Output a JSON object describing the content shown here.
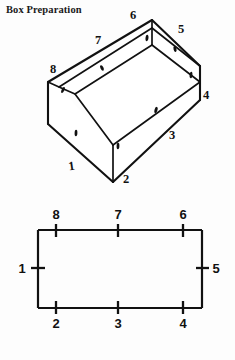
{
  "page": {
    "title": "Box Preparation",
    "background_color": "#fdfdfd",
    "ink_color": "#111111",
    "width": 235,
    "height": 360
  },
  "box_figure": {
    "name": "open-box-isometric",
    "description": "Open rectangular box drawn in oblique projection with eight numbered edge labels",
    "labels": [
      {
        "id": "box-label-1",
        "text": "1",
        "x": 72,
        "y": 170
      },
      {
        "id": "box-label-2",
        "text": "2",
        "x": 126,
        "y": 183
      },
      {
        "id": "box-label-3",
        "text": "3",
        "x": 172,
        "y": 139
      },
      {
        "id": "box-label-4",
        "text": "4",
        "x": 204,
        "y": 98
      },
      {
        "id": "box-label-5",
        "text": "5",
        "x": 181,
        "y": 31
      },
      {
        "id": "box-label-6",
        "text": "6",
        "x": 133,
        "y": 18
      },
      {
        "id": "box-label-7",
        "text": "7",
        "x": 98,
        "y": 42
      },
      {
        "id": "box-label-8",
        "text": "8",
        "x": 53,
        "y": 71
      }
    ],
    "score_marks": [
      {
        "id": "score-mark-a",
        "x": 102,
        "y": 68
      },
      {
        "id": "score-mark-b",
        "x": 147,
        "y": 38
      },
      {
        "id": "score-mark-c",
        "x": 175,
        "y": 49
      },
      {
        "id": "score-mark-d",
        "x": 191,
        "y": 75
      },
      {
        "id": "score-mark-e",
        "x": 156,
        "y": 110
      },
      {
        "id": "score-mark-f",
        "x": 118,
        "y": 146
      },
      {
        "id": "score-mark-g",
        "x": 76,
        "y": 133
      },
      {
        "id": "score-mark-h",
        "x": 63,
        "y": 90
      }
    ]
  },
  "flat_figure": {
    "name": "box-base-rectangle",
    "description": "Flat rectangle representing the unfolded box base with eight tick marks",
    "rect": {
      "left": 38,
      "top": 230,
      "right": 202,
      "bottom": 308
    },
    "ticks": [
      {
        "id": "rect-tick-8",
        "label": "8",
        "edge": "top",
        "x": 56,
        "y": 230,
        "label_x": 56,
        "label_y": 222
      },
      {
        "id": "rect-tick-7",
        "label": "7",
        "edge": "top",
        "x": 118,
        "y": 230,
        "label_x": 118,
        "label_y": 222
      },
      {
        "id": "rect-tick-6",
        "label": "6",
        "edge": "top",
        "x": 183,
        "y": 230,
        "label_x": 183,
        "label_y": 222
      },
      {
        "id": "rect-tick-5",
        "label": "5",
        "edge": "right",
        "x": 202,
        "y": 268,
        "label_x": 214,
        "label_y": 273
      },
      {
        "id": "rect-tick-4",
        "label": "4",
        "edge": "bottom",
        "x": 183,
        "y": 308,
        "label_x": 183,
        "label_y": 326
      },
      {
        "id": "rect-tick-3",
        "label": "3",
        "edge": "bottom",
        "x": 118,
        "y": 308,
        "label_x": 118,
        "label_y": 326
      },
      {
        "id": "rect-tick-2",
        "label": "2",
        "edge": "bottom",
        "x": 56,
        "y": 308,
        "label_x": 56,
        "label_y": 326
      },
      {
        "id": "rect-tick-1",
        "label": "1",
        "edge": "left",
        "x": 38,
        "y": 268,
        "label_x": 24,
        "label_y": 273
      }
    ]
  }
}
